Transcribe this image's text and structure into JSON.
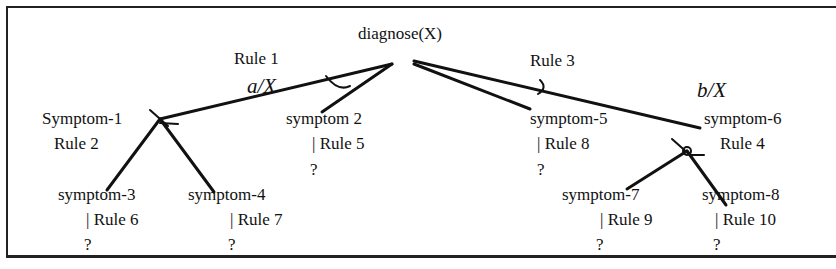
{
  "diagram": {
    "root": {
      "label": "diagnose(X)"
    },
    "rule_labels": {
      "rule1": "Rule 1",
      "rule2": "Rule 2",
      "rule3": "Rule 3",
      "rule4": "Rule 4"
    },
    "bindings": {
      "a": "a/X",
      "b": "b/X"
    },
    "nodes": {
      "symptom1": "Symptom-1",
      "symptom2": "symptom 2",
      "symptom3": "symptom-3",
      "symptom4": "symptom-4",
      "symptom5": "symptom-5",
      "symptom6": "symptom-6",
      "symptom7": "symptom-7",
      "symptom8": "symptom-8"
    },
    "leaf_rules": {
      "symptom2": "| Rule 5",
      "symptom3": "| Rule 6",
      "symptom4": "| Rule 7",
      "symptom5": "| Rule 8",
      "symptom7": "| Rule 9",
      "symptom8": "| Rule 10"
    },
    "unknown": "?",
    "colors": {
      "line": "#111111",
      "border": "#222222",
      "background": "#ffffff"
    }
  }
}
